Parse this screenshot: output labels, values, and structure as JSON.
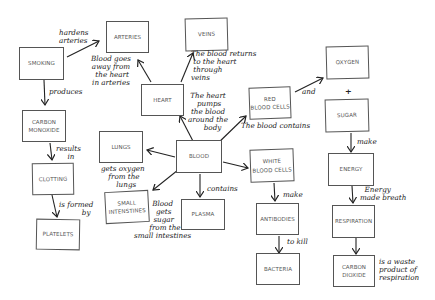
{
  "diagram": {
    "type": "concept-map",
    "nodes": {
      "smoking": "SMOKING",
      "arteries": "ARTERIES",
      "veins": "VEINS",
      "heart": "HEART",
      "carbon_monoxide": "CARBON\nMONOXIDE",
      "clotting": "CLOTTING",
      "platelets": "PLATELETS",
      "lungs": "LUNGS",
      "blood": "BLOOD",
      "small_intestines": "SMALL\nINTENSTINES",
      "plasma": "PLASMA",
      "red_blood_cells": "RED\nBLOOD CELLS",
      "white_blood_cells": "WHITE\nBLOOD CELLS",
      "antibodies": "ANTIBODIES",
      "bacteria": "BACTERIA",
      "oxygen": "OXYGEN",
      "sugar": "SUGAR",
      "energy": "ENERGY",
      "respiration": "RESPIRATION",
      "carbon_dioxide": "CARBON\nDIOXIDE"
    },
    "labels": {
      "hardens_arteries": "hardens\narteries",
      "produces": "produces",
      "results_in": "results\n     in",
      "is_formed_by": "is formed\n          by",
      "blood_goes_away": "Blood goes\naway from\n the heart\nin arteries",
      "blood_returns": "The blood returns\n to the heart\n through\nveins",
      "heart_pumps": "The heart\n pumps\nthe blood\naround the\n    body",
      "gets_oxygen": "gets oxygen\n from the\n   lungs",
      "blood_gets_sugar": "Blood\n gets\n sugar\n  from the\nsmall intestines",
      "contains": "contains",
      "the_blood_contains": "The blood contains",
      "and": "and",
      "plus": "+",
      "make_sugar": "make",
      "make_antibodies": "make",
      "to_kill": "to kill",
      "energy_made_breath": "  Energy\nmade breath",
      "waste_product": "is a waste\nproduct of\nrespiration"
    }
  }
}
